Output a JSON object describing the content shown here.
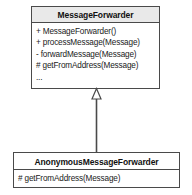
{
  "diagram": {
    "kind": "uml-class-diagram",
    "colors": {
      "line": "#4a4a4a",
      "header_fill": "#e9e9e9",
      "box_fill": "#ffffff",
      "text": "#1a1a1a"
    },
    "classes": [
      {
        "id": "parent",
        "name": "MessageForwarder",
        "members": [
          "+ MessageForwarder()",
          "+ processMessage(Message)",
          "- forwardMessage(Message)",
          "# getFromAddress(Message)",
          "..."
        ]
      },
      {
        "id": "child",
        "name": "AnonymousMessageForwarder",
        "members": [
          "# getFromAddress(Message)"
        ]
      }
    ],
    "relationships": [
      {
        "type": "generalization",
        "from": "AnonymousMessageForwarder",
        "to": "MessageForwarder",
        "arrowhead": "hollow-triangle"
      }
    ]
  }
}
